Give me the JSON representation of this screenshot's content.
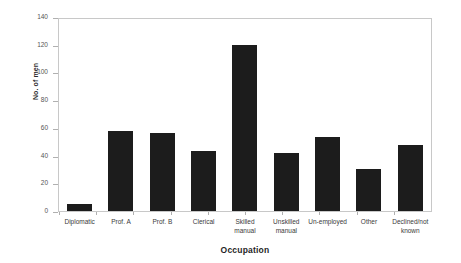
{
  "chart_data": {
    "type": "bar",
    "title": "",
    "xlabel": "Occupation",
    "ylabel": "No. of men",
    "categories": [
      "Diplomatic",
      "Prof. A",
      "Prof. B",
      "Clerical",
      "Skilled manual",
      "Unskilled manual",
      "Un-employed",
      "Other",
      "Declined/not known"
    ],
    "values": [
      5,
      58,
      57,
      44,
      121,
      42,
      54,
      31,
      48
    ],
    "ylim": [
      0,
      140
    ],
    "yticks": [
      0,
      20,
      40,
      60,
      80,
      100,
      120,
      140
    ],
    "ytick_labels": [
      "0",
      "20",
      "40",
      "60",
      "80",
      "100",
      "120",
      "140"
    ],
    "grid": false,
    "legend": false,
    "bar_color": "#1c1c1c",
    "frame_color": "#c8c8c8",
    "background": "#ffffff"
  }
}
